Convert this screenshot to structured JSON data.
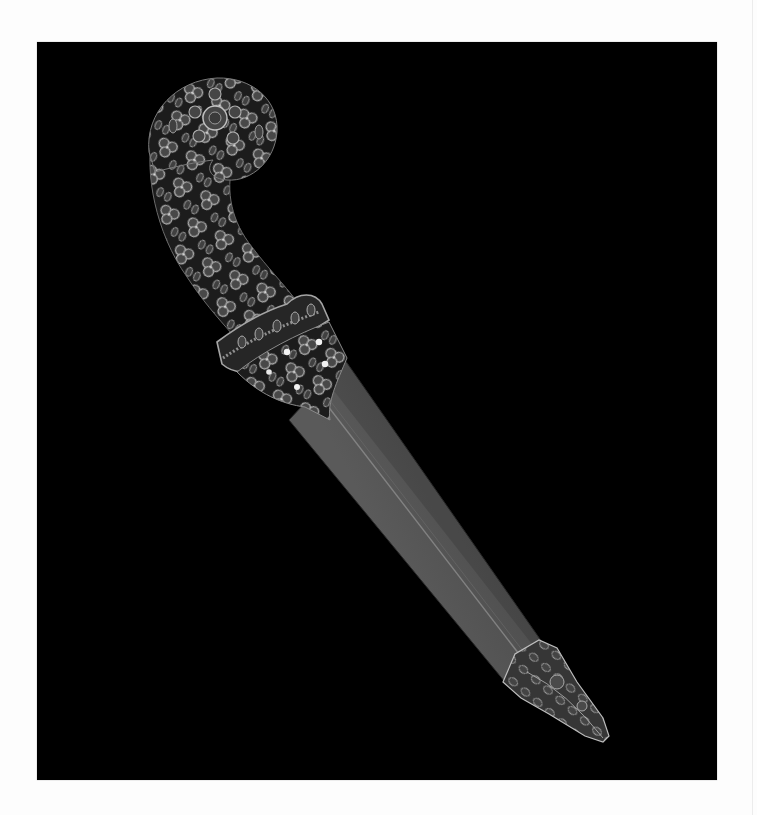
{
  "image": {
    "subject": "jeweled dagger with scabbard",
    "background_color": "#000000",
    "page_color": "#fdfdfd"
  },
  "colors": {
    "hilt_base": "#1c1c1c",
    "rosette_fill": "#4a4a4a",
    "rosette_stroke": "#b8b8b8",
    "gem_highlight": "#f2f2f2",
    "sheath_base": "#4b4b4b",
    "sheath_light": "#5c5c5c",
    "midrib": "#8a8a8a",
    "guard_band": "#9a9a9a",
    "chape_base": "#3a3a3a"
  },
  "parts": [
    {
      "name": "pommel",
      "label": ""
    },
    {
      "name": "hilt",
      "label": ""
    },
    {
      "name": "guard",
      "label": ""
    },
    {
      "name": "locket",
      "label": ""
    },
    {
      "name": "scabbard",
      "label": ""
    },
    {
      "name": "chape",
      "label": ""
    }
  ]
}
